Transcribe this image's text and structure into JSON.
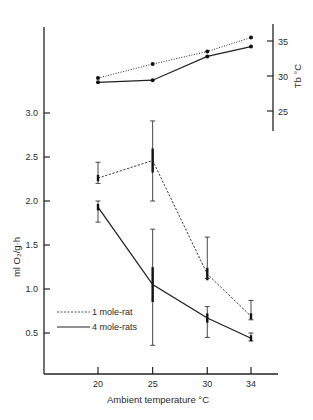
{
  "chart_data": [
    {
      "type": "line",
      "panel": "body-temperature",
      "title": "",
      "xlabel": "Ambient temperature °C",
      "ylabel": "Tb °C",
      "y_axis_side": "right",
      "categories": [
        20,
        25,
        30,
        34
      ],
      "ylim": [
        21,
        37
      ],
      "yticks": [
        25,
        30,
        35
      ],
      "series": [
        {
          "name": "1 mole-rat",
          "style": "dotted",
          "values": [
            29.7,
            31.7,
            33.5,
            35.5
          ]
        },
        {
          "name": "4 mole-rats",
          "style": "solid",
          "values": [
            29.1,
            29.4,
            32.8,
            34.2
          ]
        }
      ]
    },
    {
      "type": "line",
      "panel": "oxygen-consumption",
      "title": "",
      "xlabel": "Ambient temperature °C",
      "ylabel": "ml O₂/g·h",
      "y_axis_side": "left",
      "categories": [
        20,
        25,
        30,
        34
      ],
      "xticks": [
        "20",
        "25",
        "30",
        "34"
      ],
      "ylim": [
        0,
        3.0
      ],
      "yticks": [
        "0.5",
        "1.0",
        "1.5",
        "2.0",
        "2.5",
        "3.0"
      ],
      "grid": false,
      "legend": {
        "placement": "bottom-left",
        "entries": [
          "1 mole-rat",
          "4 mole-rats"
        ]
      },
      "series": [
        {
          "name": "1 mole-rat",
          "style": "dashed",
          "values": [
            2.26,
            2.46,
            1.17,
            0.69
          ],
          "err_low": [
            2.2,
            2.0,
            1.12,
            0.65
          ],
          "err_high": [
            2.44,
            2.91,
            1.59,
            0.87
          ]
        },
        {
          "name": "4 mole-rats",
          "style": "solid",
          "values": [
            1.93,
            1.05,
            0.67,
            0.44
          ],
          "err_low": [
            1.76,
            0.36,
            0.45,
            0.41
          ],
          "err_high": [
            2.0,
            1.68,
            0.8,
            0.5
          ]
        }
      ]
    }
  ],
  "labels": {
    "xlabel": "Ambient temperature °C",
    "ylabel_left": "ml O₂/g·h",
    "ylabel_right": "Tb °C",
    "legend_1": "1 mole-rat",
    "legend_2": "4 mole-rats"
  }
}
